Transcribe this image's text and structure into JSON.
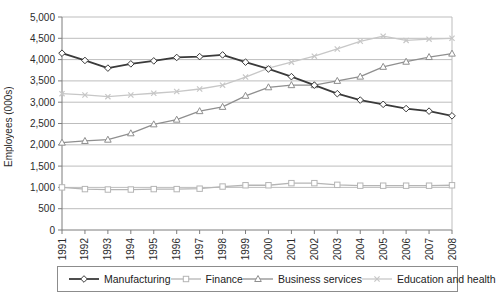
{
  "chart": {
    "ylabel": "Employees (000s)"
  },
  "chart_data": {
    "type": "line",
    "title": "",
    "xlabel": "",
    "ylabel": "Employees (000s)",
    "ylim": [
      0,
      5000
    ],
    "ytick_step": 500,
    "grid": true,
    "legend_position": "bottom",
    "x": [
      1991,
      1992,
      1993,
      1994,
      1995,
      1996,
      1997,
      1998,
      1999,
      2000,
      2001,
      2002,
      2003,
      2004,
      2005,
      2006,
      2007,
      2008
    ],
    "series": [
      {
        "name": "Manufacturing",
        "marker": "diamond",
        "color": "#3a3a3a",
        "values": [
          4150,
          3980,
          3800,
          3900,
          3970,
          4050,
          4070,
          4110,
          3940,
          3780,
          3600,
          3400,
          3200,
          3050,
          2950,
          2850,
          2790,
          2680
        ]
      },
      {
        "name": "Finance",
        "marker": "square",
        "color": "#b5b5b5",
        "values": [
          1000,
          960,
          950,
          950,
          960,
          960,
          970,
          1020,
          1050,
          1050,
          1100,
          1100,
          1060,
          1040,
          1040,
          1040,
          1040,
          1050
        ]
      },
      {
        "name": "Business services",
        "marker": "triangle",
        "color": "#8f8f8f",
        "values": [
          2050,
          2090,
          2120,
          2270,
          2480,
          2590,
          2790,
          2890,
          3150,
          3350,
          3400,
          3400,
          3500,
          3600,
          3830,
          3950,
          4060,
          4140
        ]
      },
      {
        "name": "Education and health",
        "marker": "x",
        "color": "#c7c7c7",
        "values": [
          3200,
          3170,
          3130,
          3170,
          3210,
          3250,
          3310,
          3400,
          3590,
          3800,
          3940,
          4080,
          4250,
          4430,
          4550,
          4450,
          4480,
          4500
        ]
      }
    ],
    "axis_color": "#7d7d7d",
    "grid_color": "#bdbdbd",
    "tick_label_color": "#2b2b2b"
  }
}
